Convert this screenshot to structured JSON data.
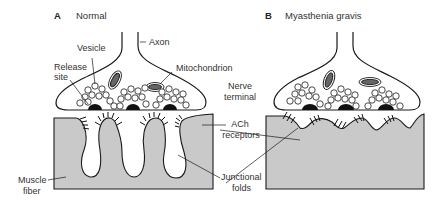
{
  "figure": {
    "panels": [
      {
        "letter": "A",
        "title": "Normal"
      },
      {
        "letter": "B",
        "title": "Myasthenia gravis"
      }
    ],
    "labels": {
      "axon": "Axon",
      "vesicle": "Vesicle",
      "release_site_1": "Release",
      "release_site_2": "site",
      "mitochondrion": "Mitochondrion",
      "nerve_terminal_1": "Nerve",
      "nerve_terminal_2": "terminal",
      "ach_receptors_1": "ACh",
      "ach_receptors_2": "receptors",
      "junctional_folds_1": "Junctional",
      "junctional_folds_2": "folds",
      "muscle_fiber_1": "Muscle",
      "muscle_fiber_2": "fiber"
    },
    "colors": {
      "muscle_fill": "#c8c8c8",
      "outline": "#1a1a1a",
      "release_site": "#111111"
    }
  }
}
